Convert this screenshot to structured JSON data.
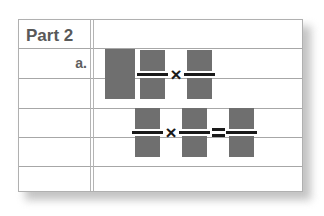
{
  "worksheet": {
    "part_title": "Part 2",
    "item_label": "a.",
    "colors": {
      "redaction_block": "#6f6f6f",
      "rule_line": "#a7a7a7",
      "margin_line": "#b4b4b4",
      "text": "#595959",
      "operator": "#1a1a1a",
      "card_background": "#ffffff",
      "card_border": "#b0b0b0",
      "page_background": "#ffffff",
      "shadow": "#b9b9b9"
    },
    "rule_lines": [
      {
        "y": 28
      },
      {
        "y": 58
      },
      {
        "y": 88
      },
      {
        "y": 117
      },
      {
        "y": 146
      }
    ],
    "margin_line_x": [
      71,
      74
    ],
    "expressions": [
      {
        "id": "expression-row-1",
        "description": "mixed number times fraction",
        "terms": [
          {
            "type": "whole-number",
            "value": ""
          },
          {
            "type": "fraction",
            "numerator": "",
            "denominator": ""
          },
          {
            "type": "operator",
            "symbol": "×",
            "name": "multiplication"
          },
          {
            "type": "fraction",
            "numerator": "",
            "denominator": ""
          }
        ]
      },
      {
        "id": "expression-row-2",
        "description": "fraction times fraction equals fraction",
        "terms": [
          {
            "type": "fraction",
            "numerator": "",
            "denominator": ""
          },
          {
            "type": "operator",
            "symbol": "×",
            "name": "multiplication"
          },
          {
            "type": "fraction",
            "numerator": "",
            "denominator": ""
          },
          {
            "type": "operator",
            "symbol": "=",
            "name": "equals"
          },
          {
            "type": "fraction",
            "numerator": "",
            "denominator": ""
          }
        ]
      }
    ]
  }
}
